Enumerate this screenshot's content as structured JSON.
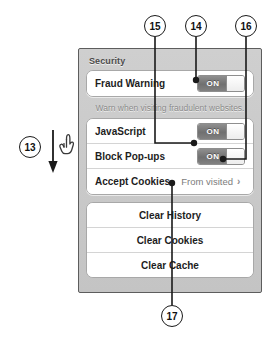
{
  "panel": {
    "section_title": "Security",
    "rows": [
      {
        "label": "Fraud Warning",
        "control": "toggle",
        "state": "ON"
      },
      {
        "label": "JavaScript",
        "control": "toggle",
        "state": "ON"
      },
      {
        "label": "Block Pop-ups",
        "control": "toggle",
        "state": "ON"
      },
      {
        "label": "Accept Cookies",
        "control": "disclosure",
        "value": "From visited",
        "chevron": "›"
      }
    ],
    "footnote": "Warn when visiting fraudulent websites.",
    "actions": [
      {
        "label": "Clear History"
      },
      {
        "label": "Clear Cookies"
      },
      {
        "label": "Clear Cache"
      }
    ]
  },
  "annotations": {
    "callouts": [
      {
        "id": "13",
        "number": "13",
        "target": "security-panel-scroll"
      },
      {
        "id": "14",
        "number": "14",
        "target": "fraud-warning-toggle"
      },
      {
        "id": "15",
        "number": "15",
        "target": "javascript-toggle"
      },
      {
        "id": "16",
        "number": "16",
        "target": "block-popups-toggle"
      },
      {
        "id": "17",
        "number": "17",
        "target": "accept-cookies-row"
      }
    ],
    "gesture": {
      "icon": "pointing-hand-cursor",
      "arrow": "down-arrow"
    }
  },
  "colors": {
    "panel_bg": "#c9c9c9",
    "panel_border": "#5d5d5d",
    "row_bg": "#ffffff",
    "label_text": "#1d1d1d",
    "muted_text": "#8a8a8a",
    "toggle_on": "#707070",
    "callout_stroke": "#1a1a1a"
  }
}
